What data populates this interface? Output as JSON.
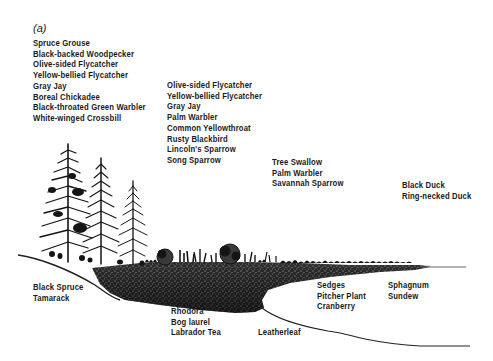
{
  "figure": {
    "panel_label": "(a)"
  },
  "bird_groups": {
    "spruce_forest": {
      "zone": "black spruce / tamarack forest",
      "species": [
        "Spruce Grouse",
        "Black-backed Woodpecker",
        "Olive-sided Flycatcher",
        "Yellow-bellied Flycatcher",
        "Gray Jay",
        "Boreal Chickadee",
        "Black-throated Green Warbler",
        "White-winged Crossbill"
      ]
    },
    "shrub_zone": {
      "zone": "shrub bog",
      "species": [
        "Olive-sided Flycatcher",
        "Yellow-bellied Flycatcher",
        "Gray Jay",
        "Palm Warbler",
        "Common Yellowthroat",
        "Rusty Blackbird",
        "Lincoln's Sparrow",
        "Song Sparrow"
      ]
    },
    "sedge_mat": {
      "zone": "sedge mat",
      "species": [
        "Tree Swallow",
        "Palm Warbler",
        "Savannah Sparrow"
      ]
    },
    "open_water": {
      "zone": "open water",
      "species": [
        "Black Duck",
        "Ring-necked Duck"
      ]
    }
  },
  "plant_groups": {
    "forest_plants": {
      "species": [
        "Black Spruce",
        "Tamarack"
      ]
    },
    "shrub_plants": {
      "species": [
        "Rhodora",
        "Bog laurel",
        "Labrador Tea"
      ]
    },
    "leatherleaf": {
      "species": [
        "Leatherleaf"
      ]
    },
    "mat_plants": {
      "species": [
        "Sedges",
        "Pitcher Plant",
        "Cranberry"
      ]
    },
    "edge_plants": {
      "species": [
        "Sphagnum",
        "Sundew"
      ]
    }
  },
  "colors": {
    "ink": "#1a1a1a",
    "mat_dark": "#2a2a2a",
    "mat_mid": "#555555",
    "background": "#ffffff"
  }
}
